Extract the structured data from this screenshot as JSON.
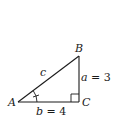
{
  "diagram": {
    "type": "right-triangle",
    "vertices": {
      "A": {
        "label": "A",
        "x": 18,
        "y": 102
      },
      "B": {
        "label": "B",
        "x": 79,
        "y": 56
      },
      "C": {
        "label": "C",
        "x": 79,
        "y": 102
      }
    },
    "sides": {
      "a": {
        "var": "a",
        "eq": " = 3",
        "value": 3
      },
      "b": {
        "var": "b",
        "eq": " = 4",
        "value": 4
      },
      "c": {
        "var": "c"
      }
    },
    "right_angle_at": "C",
    "marked_angle_at": "A",
    "colors": {
      "stroke": "#1a1a1a",
      "background": "#ffffff"
    }
  }
}
